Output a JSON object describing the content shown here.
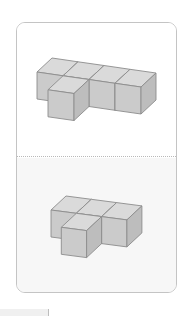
{
  "colors": {
    "card_border": "#c4c4c4",
    "bottom_panel_bg": "#f7f7f7",
    "cube_top": "#dadada",
    "cube_front": "#cbcbcb",
    "cube_side": "#bdbdbd",
    "cube_edge": "#8c8c8c"
  },
  "options": [
    {
      "label": "figure-a",
      "origin": [
        37,
        72
      ],
      "i_vec": [
        26,
        3.75
      ],
      "d_vec": [
        15,
        -14
      ],
      "height": 27,
      "cubes": [
        {
          "i": 0,
          "j": 0
        },
        {
          "i": 1,
          "j": 0
        },
        {
          "i": 2,
          "j": 0
        },
        {
          "i": 3,
          "j": 0
        },
        {
          "i": 1,
          "j": -1
        }
      ]
    },
    {
      "label": "figure-b",
      "origin": [
        51,
        210
      ],
      "i_vec": [
        25.3,
        3.3
      ],
      "d_vec": [
        15,
        -14
      ],
      "height": 27,
      "cubes": [
        {
          "i": 0,
          "j": 0
        },
        {
          "i": 1,
          "j": 0
        },
        {
          "i": 2,
          "j": 0
        },
        {
          "i": 1,
          "j": -1
        }
      ]
    }
  ]
}
